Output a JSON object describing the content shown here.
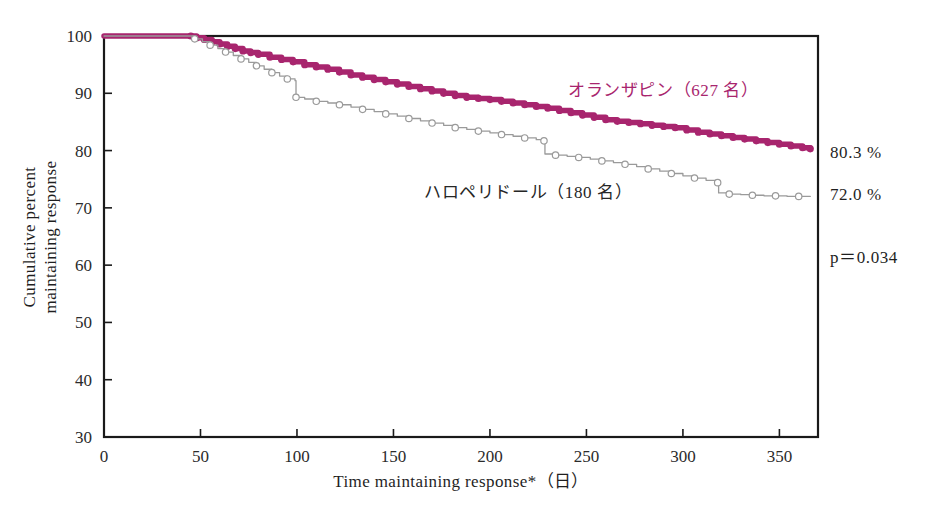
{
  "chart_data": {
    "type": "line",
    "title": "",
    "subtitle": "",
    "xlabel": "Time maintaining response*（日）",
    "ylabel_line1": "Cumulative percent",
    "ylabel_line2": "maintaining response",
    "xlim": [
      0,
      370
    ],
    "ylim": [
      30,
      100
    ],
    "xticks": [
      0,
      50,
      100,
      150,
      200,
      250,
      300,
      350
    ],
    "xtick_labels": [
      "0",
      "50",
      "100",
      "150",
      "200",
      "250",
      "300",
      "350"
    ],
    "yticks": [
      30,
      40,
      50,
      60,
      70,
      80,
      90,
      100
    ],
    "ytick_labels": [
      "30",
      "40",
      "50",
      "60",
      "70",
      "80",
      "90",
      "100"
    ],
    "grid": false,
    "legend_position": "inside-right",
    "baseline_dashed_y": 100,
    "baseline_dashed_x_start": 0,
    "baseline_dashed_x_end": 45,
    "series": [
      {
        "name": "オランザピン（627 名）",
        "drug": "olanzapine",
        "n": 627,
        "color": "#a8256e",
        "marker": "filled-circle",
        "end_label": "80.3 %",
        "end_value": 80.3,
        "x": [
          0,
          45,
          48,
          52,
          56,
          60,
          64,
          68,
          72,
          76,
          80,
          86,
          92,
          98,
          104,
          110,
          116,
          122,
          128,
          134,
          140,
          146,
          152,
          158,
          164,
          170,
          176,
          182,
          188,
          194,
          200,
          206,
          212,
          218,
          224,
          230,
          236,
          242,
          248,
          254,
          260,
          266,
          272,
          278,
          284,
          290,
          296,
          302,
          308,
          314,
          320,
          326,
          332,
          338,
          344,
          350,
          356,
          362,
          366
        ],
        "y": [
          100,
          100,
          99.7,
          99.4,
          99.0,
          98.6,
          98.2,
          97.8,
          97.4,
          97.1,
          96.8,
          96.3,
          95.9,
          95.5,
          95.0,
          94.6,
          94.2,
          93.7,
          93.2,
          92.8,
          92.4,
          92.0,
          91.6,
          91.2,
          90.8,
          90.4,
          90.0,
          89.6,
          89.3,
          89.1,
          88.9,
          88.6,
          88.3,
          88.0,
          87.7,
          87.4,
          87.0,
          86.6,
          86.2,
          85.8,
          85.4,
          85.1,
          84.9,
          84.7,
          84.4,
          84.2,
          84.0,
          83.6,
          83.2,
          82.9,
          82.6,
          82.3,
          82.0,
          81.7,
          81.4,
          81.1,
          80.8,
          80.5,
          80.3
        ]
      },
      {
        "name": "ハロペリドール（180 名）",
        "drug": "haloperidol",
        "n": 180,
        "color": "#9a9a9a",
        "marker": "open-circle",
        "end_label": "72.0 %",
        "end_value": 72.0,
        "x": [
          0,
          43,
          47,
          51,
          55,
          59,
          63,
          67,
          71,
          75,
          79,
          83,
          87,
          91,
          95,
          99,
          99.5,
          104,
          110,
          116,
          122,
          128,
          134,
          140,
          146,
          152,
          158,
          164,
          170,
          176,
          182,
          188,
          194,
          200,
          206,
          212,
          218,
          224,
          228,
          228.5,
          234,
          240,
          246,
          252,
          258,
          264,
          270,
          276,
          282,
          288,
          294,
          300,
          306,
          312,
          318,
          318.5,
          324,
          330,
          336,
          342,
          348,
          354,
          360,
          366
        ],
        "y": [
          100,
          100,
          99.5,
          99.0,
          98.4,
          97.8,
          97.2,
          96.6,
          96.0,
          95.4,
          94.8,
          94.2,
          93.6,
          93.0,
          92.5,
          92.2,
          89.3,
          89.0,
          88.6,
          88.3,
          88.0,
          87.6,
          87.2,
          86.8,
          86.4,
          86.0,
          85.6,
          85.2,
          84.8,
          84.4,
          84.0,
          83.7,
          83.4,
          83.1,
          82.8,
          82.5,
          82.2,
          81.9,
          81.7,
          79.4,
          79.2,
          79.0,
          78.8,
          78.5,
          78.2,
          77.9,
          77.6,
          77.2,
          76.8,
          76.4,
          76.0,
          75.6,
          75.2,
          74.8,
          74.4,
          72.6,
          72.4,
          72.3,
          72.2,
          72.1,
          72.1,
          72.0,
          72.0,
          72.0
        ]
      }
    ],
    "annotations": [
      {
        "id": "olz-end-pct",
        "text": "80.3 %"
      },
      {
        "id": "hal-end-pct",
        "text": "72.0 %"
      },
      {
        "id": "p-value",
        "text": "p＝0.034"
      }
    ]
  },
  "legend": {
    "olanzapine_label": "オランザピン（627 名）",
    "haloperidol_label": "ハロペリドール（180 名）"
  },
  "colors": {
    "olanzapine": "#a8256e",
    "haloperidol": "#9a9a9a",
    "axis": "#1a1a1a",
    "text": "#1f1f1f"
  }
}
